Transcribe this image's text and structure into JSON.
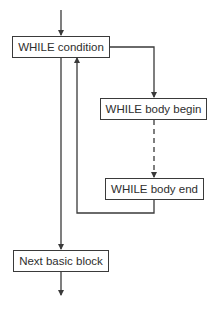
{
  "diagram": {
    "type": "flowchart",
    "nodes": [
      {
        "id": "while_condition",
        "label": "WHILE condition"
      },
      {
        "id": "while_body_begin",
        "label": "WHILE body begin"
      },
      {
        "id": "while_body_end",
        "label": "WHILE body end"
      },
      {
        "id": "next_basic_block",
        "label": "Next basic block"
      }
    ],
    "edges": [
      {
        "from": "entry",
        "to": "while_condition",
        "style": "solid"
      },
      {
        "from": "while_condition",
        "to": "while_body_begin",
        "style": "solid"
      },
      {
        "from": "while_body_begin",
        "to": "while_body_end",
        "style": "dashed"
      },
      {
        "from": "while_body_end",
        "to": "while_condition",
        "style": "solid"
      },
      {
        "from": "while_condition",
        "to": "next_basic_block",
        "style": "solid"
      },
      {
        "from": "next_basic_block",
        "to": "exit",
        "style": "solid"
      }
    ],
    "colors": {
      "stroke": "#3a3a3a",
      "text": "#2e2e2e",
      "background": "#ffffff"
    }
  }
}
